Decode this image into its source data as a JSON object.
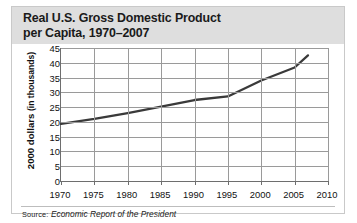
{
  "figure": {
    "title": "Real U.S. Gross Domestic Product\nper Capita, 1970–2007",
    "source_prefix": "Source:",
    "source_text": "Economic Report of the President"
  },
  "axes": {
    "ylabel_bold": "2000 dollars",
    "ylabel_normal": "(in thousands)",
    "yticks": [
      "0",
      "5",
      "10",
      "15",
      "20",
      "25",
      "30",
      "35",
      "40",
      "45"
    ],
    "xticks": [
      "1970",
      "1975",
      "1980",
      "1985",
      "1990",
      "1995",
      "2000",
      "2005",
      "2010"
    ]
  },
  "chart_data": {
    "type": "line",
    "title": "Real U.S. Gross Domestic Product per Capita, 1970–2007",
    "xlabel": "",
    "ylabel": "2000 dollars (in thousands)",
    "xlim": [
      1970,
      2010
    ],
    "ylim": [
      0,
      45
    ],
    "ytick_values": [
      0,
      5,
      10,
      15,
      20,
      25,
      30,
      35,
      40,
      45
    ],
    "xtick_values": [
      1970,
      1975,
      1980,
      1985,
      1990,
      1995,
      2000,
      2005,
      2010
    ],
    "grid": true,
    "legend": "none",
    "line_color": "#3a3a3a",
    "series": [
      {
        "name": "Real GDP per capita",
        "x": [
          1970,
          1975,
          1980,
          1985,
          1990,
          1995,
          2000,
          2005,
          2007
        ],
        "values": [
          19.3,
          21.0,
          23.0,
          25.2,
          27.4,
          28.6,
          34.0,
          38.4,
          42.5
        ]
      }
    ]
  }
}
